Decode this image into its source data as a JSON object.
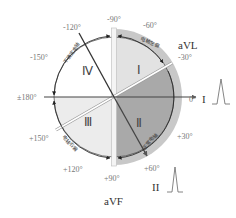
{
  "diagram": {
    "title": "",
    "type": "ECG hexaxial reference / QRS axis quadrants",
    "colors": {
      "quadrant_I_fill": "#e2e2e2",
      "quadrant_II_fill": "#a9a9a9",
      "quadrant_III_fill": "#ececec",
      "quadrant_IV_fill": "#ffffff",
      "outer_band": "#c8c8c8",
      "axis_line": "#444444"
    },
    "quadrants": [
      {
        "id": "I",
        "label": "Ⅰ",
        "range": "-30° to -90°",
        "arc_label": "电轴左偏"
      },
      {
        "id": "II",
        "label": "Ⅱ",
        "range": "-30° to +90°",
        "arc_label": "正常电轴"
      },
      {
        "id": "III",
        "label": "Ⅲ",
        "range": "+90° to +180°",
        "arc_label": "电轴右偏"
      },
      {
        "id": "IV",
        "label": "Ⅳ",
        "range": "-90° to -180°",
        "arc_label": "不确定电轴"
      }
    ],
    "angle_labels": {
      "m90": "-90°",
      "m60": "-60°",
      "m30": "-30°",
      "zero": "0°",
      "p30": "+30°",
      "p60": "+60°",
      "p90": "+90°",
      "p120": "+120°",
      "p150": "+150°",
      "pm180": "±180°",
      "m150": "-150°",
      "m120": "-120°"
    },
    "leads": {
      "avl": "aVL",
      "lead_i": "I",
      "lead_ii": "II",
      "avf": "aVF"
    }
  }
}
